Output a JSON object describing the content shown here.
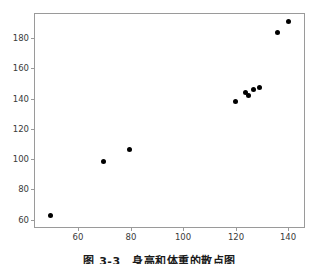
{
  "chart_data": {
    "type": "scatter",
    "title": "",
    "xlabel": "",
    "ylabel": "",
    "xlim": [
      44,
      146
    ],
    "ylim": [
      52,
      194
    ],
    "xticks": [
      60,
      80,
      100,
      120,
      140
    ],
    "yticks": [
      60,
      80,
      100,
      120,
      140,
      160,
      180
    ],
    "xticklabels": [
      "60",
      "80",
      "100",
      "120",
      "140"
    ],
    "yticklabels": [
      "60",
      "80",
      "100",
      "120",
      "140",
      "160",
      "180"
    ],
    "grid": false,
    "legend": null,
    "marker": "circle",
    "marker_color": "#000000",
    "series": [
      {
        "name": "observations",
        "points": [
          {
            "x": 50,
            "y": 60
          },
          {
            "x": 70,
            "y": 96
          },
          {
            "x": 80,
            "y": 104
          },
          {
            "x": 120,
            "y": 135.5
          },
          {
            "x": 124,
            "y": 141.5
          },
          {
            "x": 125,
            "y": 139.5
          },
          {
            "x": 127,
            "y": 144
          },
          {
            "x": 129,
            "y": 145
          },
          {
            "x": 136,
            "y": 182
          },
          {
            "x": 140,
            "y": 189
          }
        ]
      }
    ]
  },
  "caption": {
    "text": "图 3-3　身高和体重的散点图"
  }
}
